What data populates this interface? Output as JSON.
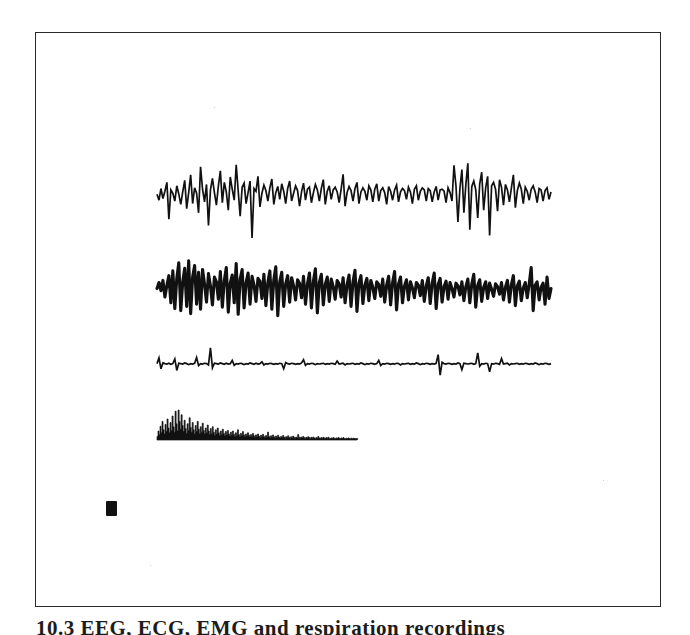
{
  "document": {
    "kind": "scanned-figure",
    "background_color": "#ffffff",
    "ink_color": "#111111",
    "frame_color": "#2a2a2a"
  },
  "frame": {
    "x": 35,
    "y": 32,
    "width": 626,
    "height": 575
  },
  "caption": {
    "text": "10.3  EEG, ECG, EMG and respiration recordings",
    "clipped": true
  },
  "scale_mark": {
    "x": 106,
    "y": 501,
    "width": 11,
    "height": 15
  },
  "chart_data": {
    "type": "line",
    "title": "",
    "subtitle": "",
    "xlabel": "",
    "ylabel": "",
    "grid": false,
    "legend_position": "none",
    "axis_visible": false,
    "x_range": [
      0,
      1
    ],
    "series": [
      {
        "name": "trace-1",
        "style": "spiky-transient",
        "baseline_y": 196,
        "x_start": 157,
        "x_end": 551,
        "amplitude_up": 34,
        "amplitude_down": 42,
        "line_width": 1.7,
        "fill": false,
        "values": [
          0.05,
          -0.1,
          0.22,
          -0.06,
          0.14,
          0.4,
          -0.55,
          0.18,
          0.08,
          -0.12,
          0.3,
          0.06,
          -0.2,
          0.12,
          0.46,
          -0.3,
          0.1,
          0.62,
          -0.18,
          0.24,
          0.08,
          -0.4,
          0.86,
          0.2,
          -0.14,
          0.34,
          -0.7,
          0.18,
          0.52,
          0.1,
          -0.22,
          0.3,
          0.74,
          -0.16,
          0.4,
          0.12,
          -0.34,
          0.56,
          0.2,
          -0.1,
          0.92,
          0.16,
          -0.48,
          0.26,
          0.38,
          -0.18,
          0.1,
          0.44,
          -1.0,
          0.22,
          0.14,
          0.58,
          -0.26,
          0.08,
          0.32,
          0.16,
          -0.12,
          0.24,
          0.5,
          -0.2,
          0.1,
          0.28,
          -0.08,
          0.36,
          0.14,
          -0.18,
          0.22,
          0.44,
          -0.12,
          0.08,
          0.3,
          0.16,
          -0.24,
          0.12,
          0.38,
          -0.1,
          0.2,
          0.26,
          -0.16,
          0.1,
          0.34,
          0.18,
          -0.12,
          0.22,
          0.48,
          -0.2,
          0.14,
          0.3,
          -0.08,
          0.18,
          0.26,
          0.12,
          -0.16,
          0.2,
          0.64,
          -0.24,
          0.1,
          0.28,
          0.16,
          -0.12,
          0.22,
          0.4,
          -0.18,
          0.12,
          0.24,
          0.14,
          -0.1,
          0.3,
          0.18,
          -0.14,
          0.2,
          0.36,
          -0.12,
          0.16,
          0.24,
          0.1,
          -0.2,
          0.28,
          0.14,
          -0.1,
          0.18,
          0.32,
          -0.14,
          0.12,
          0.22,
          0.16,
          -0.08,
          0.26,
          0.12,
          -0.18,
          0.2,
          0.3,
          -0.1,
          0.14,
          0.24,
          0.18,
          -0.12,
          0.22,
          0.16,
          -0.14,
          0.12,
          0.28,
          -0.1,
          0.18,
          0.2,
          0.14,
          -0.16,
          0.24,
          0.1,
          -0.12,
          0.9,
          0.3,
          -0.62,
          0.22,
          0.78,
          -0.4,
          0.34,
          0.96,
          -0.8,
          0.28,
          0.44,
          0.18,
          -0.52,
          0.36,
          0.7,
          -0.34,
          0.24,
          0.58,
          -0.94,
          0.3,
          0.4,
          0.2,
          -0.36,
          0.48,
          0.26,
          -0.22,
          0.34,
          0.18,
          -0.14,
          0.24,
          0.62,
          -0.28,
          0.16,
          0.38,
          0.2,
          -0.18,
          0.26,
          0.14,
          -0.1,
          0.2,
          0.3,
          0.12,
          -0.16,
          0.22,
          0.18,
          -0.12,
          0.16,
          0.24,
          -0.08,
          0.12
        ]
      },
      {
        "name": "trace-2",
        "style": "oscillatory-thick",
        "baseline_y": 292,
        "x_start": 157,
        "x_end": 551,
        "amplitude_up": 34,
        "amplitude_down": 36,
        "line_width": 3.1,
        "fill": false,
        "values": [
          0.1,
          0.28,
          0.04,
          0.34,
          -0.14,
          0.2,
          0.48,
          -0.3,
          0.62,
          -0.46,
          0.4,
          0.86,
          -0.52,
          0.3,
          0.7,
          -0.4,
          0.92,
          -0.6,
          0.44,
          0.78,
          -0.34,
          0.58,
          -0.48,
          0.66,
          0.24,
          -0.28,
          0.54,
          0.18,
          -0.36,
          0.44,
          0.3,
          -0.2,
          0.6,
          -0.42,
          0.34,
          0.72,
          -0.56,
          0.26,
          0.5,
          -0.3,
          0.84,
          -0.62,
          0.38,
          0.66,
          -0.44,
          0.28,
          0.56,
          -0.34,
          0.46,
          0.2,
          -0.26,
          0.4,
          0.32,
          -0.18,
          0.52,
          -0.38,
          0.28,
          0.62,
          -0.48,
          0.36,
          0.74,
          -0.66,
          0.3,
          0.58,
          -0.4,
          0.24,
          0.48,
          -0.28,
          0.42,
          0.18,
          -0.22,
          0.36,
          0.26,
          -0.16,
          0.46,
          -0.34,
          0.24,
          0.56,
          -0.44,
          0.32,
          0.68,
          -0.58,
          0.28,
          0.52,
          -0.36,
          0.22,
          0.44,
          -0.26,
          0.38,
          0.16,
          -0.2,
          0.34,
          0.24,
          -0.14,
          0.42,
          -0.3,
          0.22,
          0.5,
          -0.4,
          0.3,
          0.64,
          -0.54,
          0.26,
          0.48,
          -0.32,
          0.2,
          0.4,
          -0.24,
          0.34,
          0.14,
          -0.18,
          0.3,
          0.22,
          -0.12,
          0.38,
          -0.28,
          0.2,
          0.46,
          -0.36,
          0.28,
          0.6,
          -0.5,
          0.24,
          0.44,
          -0.3,
          0.18,
          0.36,
          -0.22,
          0.3,
          0.12,
          -0.16,
          0.28,
          0.2,
          -0.1,
          0.34,
          -0.26,
          0.18,
          0.42,
          -0.32,
          0.26,
          0.56,
          -0.46,
          0.22,
          0.4,
          -0.28,
          0.16,
          0.32,
          -0.2,
          0.28,
          0.1,
          -0.14,
          0.26,
          0.18,
          -0.08,
          0.3,
          -0.24,
          0.16,
          0.38,
          -0.3,
          0.24,
          0.52,
          -0.42,
          0.2,
          0.36,
          -0.26,
          0.14,
          0.3,
          -0.18,
          0.26,
          0.08,
          -0.12,
          0.24,
          0.16,
          -0.06,
          0.28,
          -0.22,
          0.14,
          0.34,
          -0.28,
          0.22,
          0.48,
          -0.38,
          0.18,
          0.32,
          -0.24,
          0.12,
          0.28,
          -0.16,
          0.24,
          0.72,
          -0.52,
          0.2,
          0.3,
          -0.22,
          0.14,
          0.26,
          -0.34,
          0.44,
          -0.18,
          0.1
        ]
      },
      {
        "name": "trace-3",
        "style": "sparse-flat-baseline",
        "baseline_y": 364,
        "x_start": 157,
        "x_end": 551,
        "amplitude_up": 18,
        "amplitude_down": 16,
        "line_width": 1.7,
        "fill": false,
        "values": [
          0.02,
          0.34,
          -0.3,
          0.06,
          0.02,
          0.0,
          0.04,
          -0.02,
          0.02,
          0.28,
          -0.4,
          0.04,
          0.02,
          0.0,
          0.06,
          0.02,
          -0.04,
          0.02,
          0.0,
          0.04,
          0.36,
          -0.1,
          0.02,
          0.0,
          0.04,
          0.02,
          -0.06,
          0.9,
          -0.24,
          0.04,
          0.02,
          0.0,
          0.06,
          0.02,
          -0.02,
          0.04,
          0.0,
          0.02,
          0.2,
          -0.08,
          0.02,
          0.0,
          0.04,
          0.02,
          -0.04,
          0.02,
          0.0,
          0.06,
          0.02,
          -0.02,
          0.04,
          0.0,
          0.02,
          0.12,
          -0.06,
          0.02,
          0.0,
          0.04,
          0.02,
          -0.02,
          0.02,
          0.0,
          0.04,
          0.02,
          -0.3,
          0.08,
          0.02,
          0.0,
          0.04,
          0.02,
          -0.02,
          0.02,
          0.0,
          0.06,
          0.24,
          -0.08,
          0.02,
          0.0,
          0.04,
          0.02,
          -0.04,
          0.02,
          0.0,
          0.02,
          0.04,
          -0.02,
          0.02,
          0.0,
          0.04,
          0.02,
          -0.02,
          0.16,
          0.0,
          0.02,
          0.04,
          -0.06,
          0.02,
          0.0,
          0.02,
          0.04,
          -0.02,
          0.02,
          0.0,
          0.06,
          0.02,
          -0.04,
          0.02,
          0.0,
          0.04,
          0.02,
          -0.02,
          0.02,
          0.2,
          -0.1,
          0.02,
          0.0,
          0.04,
          0.02,
          -0.02,
          0.02,
          0.0,
          0.04,
          0.02,
          -0.06,
          0.02,
          0.0,
          0.02,
          0.04,
          -0.02,
          0.02,
          0.0,
          0.06,
          0.02,
          -0.04,
          0.02,
          0.0,
          0.04,
          0.02,
          -0.02,
          0.02,
          0.0,
          0.04,
          0.52,
          -0.7,
          0.1,
          0.02,
          0.0,
          0.04,
          0.02,
          -0.02,
          0.02,
          0.0,
          0.06,
          0.02,
          -0.36,
          0.04,
          0.02,
          0.0,
          0.02,
          0.04,
          -0.02,
          0.02,
          0.62,
          -0.14,
          0.02,
          0.0,
          0.04,
          0.02,
          -0.48,
          0.02,
          0.0,
          0.04,
          0.02,
          -0.02,
          0.3,
          0.0,
          0.02,
          0.04,
          -0.06,
          0.02,
          0.0,
          0.02,
          0.04,
          -0.02,
          0.02,
          0.0,
          0.04,
          0.02,
          -0.02,
          0.02,
          0.0,
          0.06,
          0.02,
          -0.04,
          0.02,
          0.0,
          0.04,
          0.02,
          -0.02,
          0.02
        ]
      },
      {
        "name": "trace-4",
        "style": "filled-envelope",
        "baseline_y": 440,
        "x_start": 157,
        "x_end": 357,
        "amplitude_up": 30,
        "amplitude_down": 0,
        "line_width": 0.7,
        "fill": true,
        "values": [
          0.12,
          0.3,
          0.18,
          0.46,
          0.24,
          0.62,
          0.34,
          0.2,
          0.52,
          0.28,
          0.7,
          0.4,
          0.24,
          0.58,
          0.32,
          0.8,
          0.44,
          0.26,
          0.96,
          0.54,
          0.3,
          1.0,
          0.62,
          0.36,
          0.84,
          0.48,
          0.28,
          0.66,
          0.38,
          0.22,
          0.54,
          0.32,
          0.74,
          0.42,
          0.26,
          0.58,
          0.34,
          0.2,
          0.48,
          0.28,
          0.62,
          0.36,
          0.22,
          0.44,
          0.26,
          0.56,
          0.32,
          0.2,
          0.4,
          0.24,
          0.5,
          0.3,
          0.18,
          0.38,
          0.22,
          0.44,
          0.26,
          0.16,
          0.34,
          0.2,
          0.4,
          0.24,
          0.15,
          0.3,
          0.18,
          0.36,
          0.22,
          0.14,
          0.28,
          0.17,
          0.32,
          0.2,
          0.13,
          0.26,
          0.16,
          0.3,
          0.19,
          0.12,
          0.24,
          0.15,
          0.34,
          0.18,
          0.11,
          0.22,
          0.14,
          0.28,
          0.17,
          0.1,
          0.2,
          0.13,
          0.24,
          0.16,
          0.1,
          0.18,
          0.12,
          0.22,
          0.14,
          0.09,
          0.17,
          0.11,
          0.2,
          0.13,
          0.08,
          0.16,
          0.1,
          0.19,
          0.12,
          0.08,
          0.15,
          0.1,
          0.26,
          0.12,
          0.08,
          0.14,
          0.09,
          0.17,
          0.11,
          0.07,
          0.13,
          0.09,
          0.16,
          0.1,
          0.07,
          0.12,
          0.08,
          0.15,
          0.1,
          0.06,
          0.11,
          0.08,
          0.14,
          0.09,
          0.06,
          0.11,
          0.07,
          0.13,
          0.09,
          0.06,
          0.1,
          0.07,
          0.18,
          0.09,
          0.06,
          0.1,
          0.07,
          0.12,
          0.08,
          0.05,
          0.09,
          0.07,
          0.11,
          0.08,
          0.05,
          0.09,
          0.06,
          0.1,
          0.07,
          0.05,
          0.08,
          0.06,
          0.12,
          0.07,
          0.05,
          0.08,
          0.06,
          0.09,
          0.07,
          0.05,
          0.08,
          0.06,
          0.09,
          0.06,
          0.04,
          0.07,
          0.05,
          0.08,
          0.06,
          0.04,
          0.07,
          0.05,
          0.08,
          0.06,
          0.04,
          0.07,
          0.05,
          0.08,
          0.05,
          0.04,
          0.06,
          0.05,
          0.07,
          0.05,
          0.04,
          0.06,
          0.04,
          0.06,
          0.05,
          0.04,
          0.05,
          0.04
        ]
      }
    ]
  }
}
